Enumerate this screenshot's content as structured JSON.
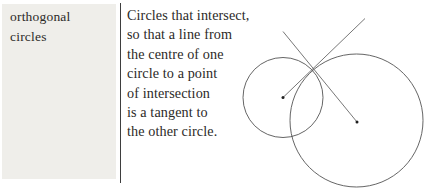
{
  "entry": {
    "term_lines": [
      "orthogonal",
      "circles"
    ],
    "definition_lines": [
      "Circles that intersect,",
      "so that a line from",
      "the centre of one",
      "circle to a point",
      "of intersection",
      "is a tangent to",
      "the other circle."
    ]
  },
  "figure": {
    "small_circle": {
      "cx": 283,
      "cy": 97.5,
      "r": 40
    },
    "large_circle": {
      "cx": 356.5,
      "cy": 120.5,
      "r": 66.5
    },
    "small_center_dot": {
      "cx": 283,
      "cy": 97.5,
      "r": 1.5
    },
    "large_center_dot": {
      "cx": 357,
      "cy": 122,
      "r": 1.5
    },
    "line_from_small_center": {
      "x1": 283,
      "y1": 97.5,
      "x2": 365,
      "y2": 18.5
    },
    "line_from_large_center": {
      "x1": 357,
      "y1": 122,
      "x2": 283,
      "y2": 31.5
    },
    "stroke_color": "#545454",
    "dot_color": "#1f1f1f"
  },
  "colors": {
    "page_background": "#ffffff",
    "term_panel_background": "#efeeea",
    "divider": "#3e3e3e",
    "text": "#2c2a28"
  }
}
